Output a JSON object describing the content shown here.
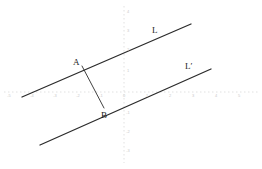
{
  "figure": {
    "kind": "parallel-lines-distance-diagram",
    "background_color": "#ffffff",
    "ink_color": "#2b2b2b",
    "axis_color": "#d0d0d0",
    "width": 262,
    "height": 169
  },
  "axes": {
    "origin_px": {
      "x": 124,
      "y": 92
    },
    "unit_px": 23,
    "x_axis": {
      "style": "dotted",
      "from_px": {
        "x": 4,
        "y": 92
      },
      "to_px": {
        "x": 258,
        "y": 92
      },
      "ticks": [
        {
          "label": "-5",
          "x_px": 9
        },
        {
          "label": "-4",
          "x_px": 32
        },
        {
          "label": "-3",
          "x_px": 55
        },
        {
          "label": "-2",
          "x_px": 78
        },
        {
          "label": "-1",
          "x_px": 101
        },
        {
          "label": "0",
          "x_px": 124
        },
        {
          "label": "1",
          "x_px": 147
        },
        {
          "label": "2",
          "x_px": 170
        },
        {
          "label": "3",
          "x_px": 193
        },
        {
          "label": "4",
          "x_px": 216
        },
        {
          "label": "5",
          "x_px": 239
        }
      ]
    },
    "y_axis": {
      "style": "dotted",
      "from_px": {
        "x": 124,
        "y": 6
      },
      "to_px": {
        "x": 124,
        "y": 163
      },
      "ticks": [
        {
          "label": "4",
          "y_px": 12
        },
        {
          "label": "3",
          "y_px": 31
        },
        {
          "label": "2",
          "y_px": 50
        },
        {
          "label": "1",
          "y_px": 71
        },
        {
          "label": "-1",
          "y_px": 113
        },
        {
          "label": "-2",
          "y_px": 132
        },
        {
          "label": "-3",
          "y_px": 151
        }
      ]
    }
  },
  "lines": [
    {
      "name": "L",
      "label": "L",
      "label_px": {
        "x": 152,
        "y": 26
      },
      "from_px": {
        "x": 22,
        "y": 97
      },
      "to_px": {
        "x": 191,
        "y": 24
      }
    },
    {
      "name": "L-prime",
      "label": "L′",
      "label_px": {
        "x": 185,
        "y": 62
      },
      "from_px": {
        "x": 40,
        "y": 145
      },
      "to_px": {
        "x": 211,
        "y": 69
      }
    }
  ],
  "segment": {
    "name": "AB",
    "from_px": {
      "x": 82,
      "y": 66
    },
    "to_px": {
      "x": 104,
      "y": 108
    }
  },
  "points": [
    {
      "label": "A",
      "x_px": 82,
      "y_px": 66,
      "label_px": {
        "x": 73,
        "y": 58
      }
    },
    {
      "label": "B",
      "x_px": 104,
      "y_px": 108,
      "label_px": {
        "x": 101,
        "y": 111
      }
    }
  ]
}
